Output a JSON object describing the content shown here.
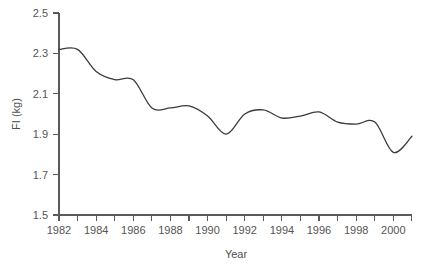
{
  "figure": {
    "background_color": "#ffffff",
    "line_color": "#3b3b3b",
    "axis_color": "#5a5a5a",
    "text_color": "#555555"
  },
  "axes": {
    "x_title": "Year",
    "y_title": "FI (kg)",
    "x_tick_labels": [
      "1982",
      "1984",
      "1986",
      "1988",
      "1990",
      "1992",
      "1994",
      "1996",
      "1998",
      "2000"
    ],
    "y_tick_labels": [
      "1.5",
      "1.7",
      "1.9",
      "2.1",
      "2.3",
      "2.5"
    ]
  },
  "caption": {
    "text": ""
  },
  "chart_data": {
    "type": "line",
    "title": "",
    "subtitle": "",
    "xlabel": "Year",
    "ylabel": "FI (kg)",
    "xlim": [
      1982,
      2001
    ],
    "ylim": [
      1.5,
      2.5
    ],
    "x_tick_step": 2,
    "x_minor_tick_step": 1,
    "y_tick_step": 0.2,
    "grid": false,
    "legend": null,
    "legend_position": "none",
    "annotations": [],
    "series": [
      {
        "name": "FI (kg)",
        "color": "#3b3b3b",
        "x": [
          1982,
          1983,
          1984,
          1985,
          1986,
          1987,
          1988,
          1989,
          1990,
          1991,
          1992,
          1993,
          1994,
          1995,
          1996,
          1997,
          1998,
          1999,
          2000,
          2001
        ],
        "values": [
          2.32,
          2.32,
          2.21,
          2.17,
          2.17,
          2.03,
          2.03,
          2.04,
          1.99,
          1.9,
          2.0,
          2.02,
          1.98,
          1.99,
          2.01,
          1.96,
          1.95,
          1.96,
          1.81,
          1.89
        ]
      }
    ]
  }
}
